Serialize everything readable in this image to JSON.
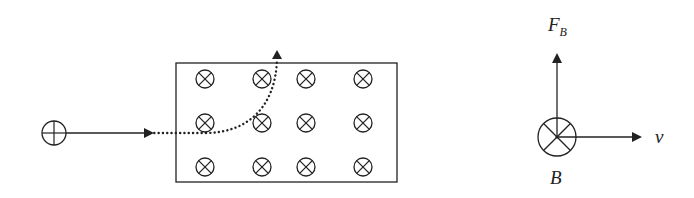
{
  "diagram": {
    "type": "physics-magnetic-force",
    "colors": {
      "stroke": "#222222",
      "background": "#ffffff"
    },
    "left_panel": {
      "charge": {
        "symbol": "plus-circle",
        "sign": "positive",
        "cx": 54,
        "cy": 133,
        "r": 12
      },
      "velocity_arrow": {
        "x1": 66,
        "y1": 133,
        "x2": 152,
        "y2": 133
      },
      "field_region": {
        "x": 176,
        "y": 63,
        "width": 221,
        "height": 119,
        "field_symbol": "x-in-circle",
        "field_direction": "into page",
        "columns_x": [
          205,
          262,
          306,
          363
        ],
        "rows_y": [
          79,
          123,
          167
        ],
        "symbol_r": 9
      },
      "trajectory": {
        "style": "dotted",
        "path": "M 150 133 L 205 133 C 245 133, 275 110, 277 60",
        "arrow_tip": {
          "x": 277,
          "y": 50
        }
      }
    },
    "right_panel": {
      "center": {
        "cx": 557,
        "cy": 137,
        "r": 19
      },
      "force_arrow": {
        "x": 557,
        "y_from": 137,
        "y_to": 55
      },
      "velocity_arrow": {
        "y": 137,
        "x_from": 557,
        "x_to": 640
      },
      "labels": {
        "force": {
          "main": "F",
          "subscript": "B"
        },
        "velocity": "v",
        "field": "B"
      }
    }
  }
}
